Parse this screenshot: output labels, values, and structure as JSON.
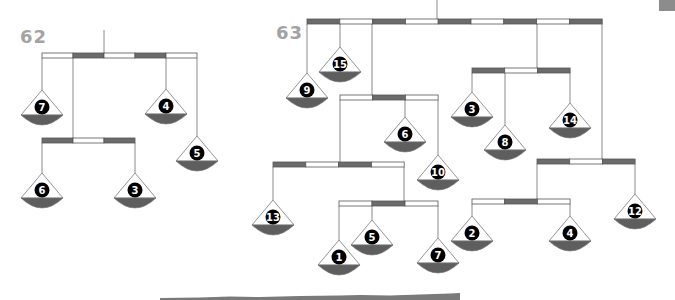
{
  "colors": {
    "beam_dark": "#6b6b6b",
    "beam_light": "#ffffff",
    "beam_outline": "#555555",
    "string": "#8a8a8a",
    "pan_outline": "#777777",
    "pan_bowl": "#5e5e5e",
    "number_circle": "#000000",
    "label": "#a3a3a3",
    "corner_tab": "#8c8c8c"
  },
  "puzzles": [
    {
      "id": "62",
      "label": "62",
      "label_pos": {
        "x": 20,
        "y": 26
      },
      "hanger": {
        "x": 104,
        "y1": 30,
        "y2": 53
      },
      "beams": [
        {
          "x": 42,
          "y": 53,
          "seg": 31,
          "h": 5,
          "pattern": [
            "light",
            "dark",
            "light",
            "dark",
            "light"
          ]
        },
        {
          "x": 42,
          "y": 138,
          "seg": 31,
          "h": 5,
          "pattern": [
            "dark",
            "light",
            "dark"
          ]
        }
      ],
      "strings": [
        {
          "x": 42,
          "y1": 58,
          "y2": 90
        },
        {
          "x": 73,
          "y1": 58,
          "y2": 138
        },
        {
          "x": 166,
          "y1": 58,
          "y2": 89
        },
        {
          "x": 197,
          "y1": 58,
          "y2": 136
        },
        {
          "x": 42,
          "y1": 143,
          "y2": 173
        },
        {
          "x": 135,
          "y1": 143,
          "y2": 173
        }
      ],
      "pans": [
        {
          "value": "7",
          "x": 42,
          "y": 90
        },
        {
          "value": "4",
          "x": 166,
          "y": 89
        },
        {
          "value": "5",
          "x": 197,
          "y": 136
        },
        {
          "value": "6",
          "x": 42,
          "y": 173
        },
        {
          "value": "3",
          "x": 135,
          "y": 173
        }
      ]
    },
    {
      "id": "63",
      "label": "63",
      "label_pos": {
        "x": 276,
        "y": 22
      },
      "hanger": {
        "x": 437,
        "y1": 0,
        "y2": 19
      },
      "beams": [
        {
          "x": 307,
          "y": 19,
          "seg": 32.8,
          "h": 5,
          "pattern": [
            "dark",
            "light",
            "dark",
            "light",
            "dark",
            "light",
            "dark",
            "light",
            "dark"
          ]
        },
        {
          "x": 472,
          "y": 68,
          "seg": 32.7,
          "h": 5,
          "pattern": [
            "dark",
            "light",
            "dark"
          ]
        },
        {
          "x": 340,
          "y": 95,
          "seg": 32.7,
          "h": 5,
          "pattern": [
            "light",
            "dark",
            "light"
          ]
        },
        {
          "x": 273,
          "y": 162,
          "seg": 32.8,
          "h": 5,
          "pattern": [
            "dark",
            "light",
            "dark",
            "light"
          ]
        },
        {
          "x": 339,
          "y": 201,
          "seg": 33,
          "h": 5,
          "pattern": [
            "light",
            "dark",
            "light"
          ]
        },
        {
          "x": 537,
          "y": 159,
          "seg": 32.7,
          "h": 5,
          "pattern": [
            "dark",
            "light",
            "dark"
          ]
        },
        {
          "x": 472,
          "y": 199,
          "seg": 32.7,
          "h": 5,
          "pattern": [
            "light",
            "dark",
            "light"
          ]
        }
      ],
      "strings": [
        {
          "x": 307,
          "y1": 24,
          "y2": 73
        },
        {
          "x": 340,
          "y1": 24,
          "y2": 47
        },
        {
          "x": 372,
          "y1": 24,
          "y2": 95
        },
        {
          "x": 537,
          "y1": 24,
          "y2": 68
        },
        {
          "x": 602,
          "y1": 24,
          "y2": 159
        },
        {
          "x": 472,
          "y1": 73,
          "y2": 92
        },
        {
          "x": 505,
          "y1": 73,
          "y2": 125
        },
        {
          "x": 570,
          "y1": 73,
          "y2": 103
        },
        {
          "x": 340,
          "y1": 100,
          "y2": 162
        },
        {
          "x": 405,
          "y1": 100,
          "y2": 117
        },
        {
          "x": 438,
          "y1": 100,
          "y2": 155
        },
        {
          "x": 273,
          "y1": 167,
          "y2": 200
        },
        {
          "x": 404,
          "y1": 167,
          "y2": 201
        },
        {
          "x": 339,
          "y1": 206,
          "y2": 240
        },
        {
          "x": 372,
          "y1": 206,
          "y2": 220
        },
        {
          "x": 438,
          "y1": 206,
          "y2": 238
        },
        {
          "x": 537,
          "y1": 164,
          "y2": 199
        },
        {
          "x": 635,
          "y1": 164,
          "y2": 194
        },
        {
          "x": 472,
          "y1": 204,
          "y2": 216
        },
        {
          "x": 570,
          "y1": 204,
          "y2": 216
        }
      ],
      "pans": [
        {
          "value": "9",
          "x": 307,
          "y": 73
        },
        {
          "value": "15",
          "x": 340,
          "y": 47
        },
        {
          "value": "3",
          "x": 472,
          "y": 92
        },
        {
          "value": "8",
          "x": 505,
          "y": 125
        },
        {
          "value": "14",
          "x": 570,
          "y": 103
        },
        {
          "value": "6",
          "x": 405,
          "y": 117
        },
        {
          "value": "10",
          "x": 438,
          "y": 155
        },
        {
          "value": "13",
          "x": 273,
          "y": 200
        },
        {
          "value": "1",
          "x": 339,
          "y": 240
        },
        {
          "value": "5",
          "x": 372,
          "y": 220
        },
        {
          "value": "7",
          "x": 438,
          "y": 238
        },
        {
          "value": "12",
          "x": 635,
          "y": 194
        },
        {
          "value": "2",
          "x": 472,
          "y": 216
        },
        {
          "value": "4",
          "x": 570,
          "y": 216
        }
      ]
    }
  ]
}
